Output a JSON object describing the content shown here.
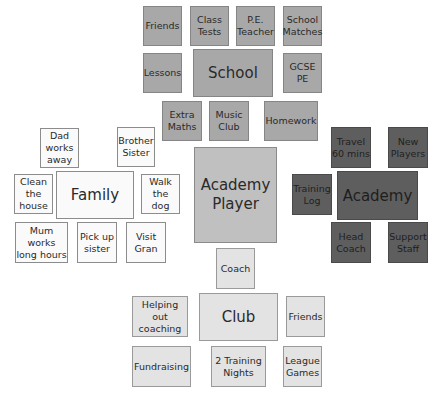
{
  "colors": {
    "school_group": "#a8a8a8",
    "academy_group": "#5e5e5e",
    "club_group": "#e3e3e3",
    "family_group": "#fafafa",
    "center": "#c0c0c0"
  },
  "center": {
    "label": "Academy\nPlayer"
  },
  "school": {
    "hub": "School",
    "items": [
      "Friends",
      "Class\nTests",
      "P.E.\nTeacher",
      "School\nMatches",
      "Lessons",
      "GCSE\nPE",
      "Extra\nMaths",
      "Music\nClub",
      "Homework"
    ]
  },
  "family": {
    "hub": "Family",
    "items": [
      "Dad\nworks\naway",
      "Brother\nSister",
      "Clean\nthe\nhouse",
      "Walk\nthe\ndog",
      "Mum works\nlong hours",
      "Pick up\nsister",
      "Visit\nGran"
    ]
  },
  "academy": {
    "hub": "Academy",
    "items": [
      "Travel\n60 mins",
      "New\nPlayers",
      "Training\nLog",
      "Head\nCoach",
      "Support\nStaff"
    ]
  },
  "club": {
    "hub": "Club",
    "items": [
      "Coach",
      "Helping out\ncoaching",
      "Friends",
      "Fundraising",
      "2 Training\nNights",
      "League\nGames"
    ]
  }
}
